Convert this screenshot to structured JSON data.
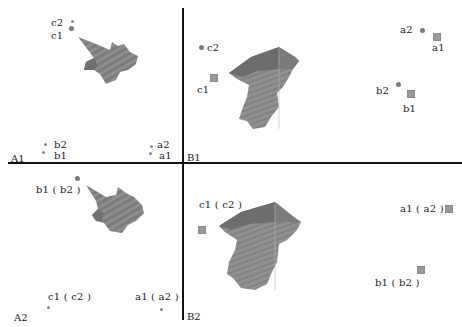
{
  "panels": {
    "A1": {
      "label": "A1",
      "points": [
        {
          "id": "c2",
          "label": "c2"
        },
        {
          "id": "c1",
          "label": "c1"
        },
        {
          "id": "b2",
          "label": "b2"
        },
        {
          "id": "b1",
          "label": "b1"
        },
        {
          "id": "a2",
          "label": "a2"
        },
        {
          "id": "a1",
          "label": "a1"
        }
      ]
    },
    "B1": {
      "label": "B1",
      "points": [
        {
          "id": "c2",
          "label": "c2"
        },
        {
          "id": "c1",
          "label": "c1"
        },
        {
          "id": "a2",
          "label": "a2"
        },
        {
          "id": "a1",
          "label": "a1"
        },
        {
          "id": "b2",
          "label": "b2"
        },
        {
          "id": "b1",
          "label": "b1"
        }
      ]
    },
    "A2": {
      "label": "A2",
      "points": [
        {
          "id": "b1b2",
          "label": "b1 ( b2 )"
        },
        {
          "id": "c1c2",
          "label": "c1 ( c2 )"
        },
        {
          "id": "a1a2",
          "label": "a1 ( a2 )"
        }
      ]
    },
    "B2": {
      "label": "B2",
      "points": [
        {
          "id": "c1c2",
          "label": "c1 ( c2 )"
        },
        {
          "id": "a1a2",
          "label": "a1 ( a2 )"
        },
        {
          "id": "b1b2",
          "label": "b1 ( b2 )"
        }
      ]
    }
  },
  "colors": {
    "shape_fill": "#8c8c8c",
    "shape_dark": "#6e6e6e",
    "marker": "#8a8a8a",
    "divider": "#111111"
  }
}
